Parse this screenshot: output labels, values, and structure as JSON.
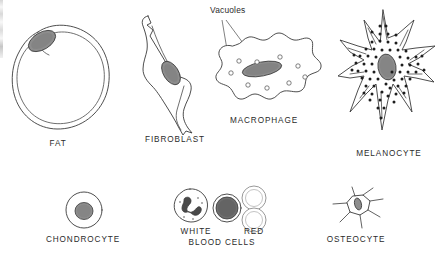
{
  "figure": {
    "background_color": "#ffffff",
    "ink_color": "#3a3a3a",
    "nucleus_fill": "#8a8a8a",
    "granule_color": "#1d1d1d",
    "width": 442,
    "height": 256
  },
  "callouts": [
    {
      "id": "vacuoles-callout",
      "text": "Vacuoles",
      "x": 210,
      "y": 10,
      "leader_targets": [
        {
          "x": 230,
          "y": 73
        },
        {
          "x": 256,
          "y": 62
        }
      ]
    }
  ],
  "cells": {
    "fat": {
      "label": "FAT",
      "label_x": 58,
      "label_y": 143,
      "description": "Large round lipid droplet with flattened nucleus at upper-left rim",
      "nucleus_count": 1
    },
    "fibroblast": {
      "label": "FIBROBLAST",
      "label_x": 175,
      "label_y": 139,
      "description": "Elongated spindle-shaped cell with central oval nucleus",
      "nucleus_count": 1
    },
    "macrophage": {
      "label": "MACROPHAGE",
      "label_x": 264,
      "label_y": 120,
      "description": "Irregular amoeboid cell with elongated nucleus and cytoplasmic vacuoles",
      "nucleus_count": 1,
      "vacuole_count": 9
    },
    "melanocyte": {
      "label": "MELANOCYTE",
      "label_x": 389,
      "label_y": 153,
      "description": "Star-shaped cell with long processes packed with dark melanin granules",
      "nucleus_count": 1,
      "granule_count": 63
    },
    "chondrocyte": {
      "label": "CHONDROCYTE",
      "label_x": 83,
      "label_y": 239,
      "description": "Round cartilage cell with single central nucleus",
      "nucleus_count": 1
    },
    "blood_cells": {
      "label_white": "WHITE",
      "label_red": "RED",
      "label_bottom": "BLOOD CELLS",
      "label_white_x": 196,
      "label_red_x": 254,
      "label_line1_y": 231,
      "label_bottom_x": 222,
      "label_bottom_y": 242,
      "white_count": 2,
      "red_count": 2,
      "white_description": "One cell with lobed segmented nucleus, one with dense round nucleus",
      "red_description": "Pale biconcave discs without nuclei"
    },
    "osteocyte": {
      "label": "OSTEOCYTE",
      "label_x": 356,
      "label_y": 239,
      "description": "Small stellate bone cell with thin radiating processes",
      "nucleus_count": 1
    }
  }
}
